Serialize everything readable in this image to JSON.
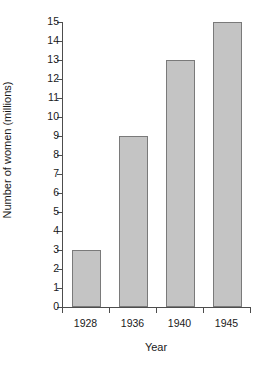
{
  "chart_data": {
    "type": "bar",
    "title": "",
    "subtitle": "",
    "categories": [
      "1928",
      "1936",
      "1940",
      "1945"
    ],
    "values": [
      3,
      9,
      13,
      15
    ],
    "series": [
      {
        "name": "Number of women (millions)",
        "values": [
          3,
          9,
          13,
          15
        ]
      }
    ],
    "xlabel": "Year",
    "ylabel": "Number of women (millions)",
    "ylim": [
      0,
      15
    ],
    "yticks": [
      0,
      1,
      2,
      3,
      4,
      5,
      6,
      7,
      8,
      9,
      10,
      11,
      12,
      13,
      14,
      15
    ],
    "ytick_labels": [
      "0",
      "1",
      "2",
      "3",
      "4",
      "5",
      "6",
      "7",
      "8",
      "9",
      "10",
      "11",
      "12",
      "13",
      "14",
      "15"
    ],
    "xtick_labels": [
      "1928",
      "1936",
      "1940",
      "1945"
    ],
    "grid": false,
    "legend": false,
    "legend_position": "none",
    "bar_color": "#c4c4c4",
    "bar_edge_color": "#7a7a7a",
    "axis_color": "#4d4d4d",
    "text_color": "#1a1a1a",
    "background_color": "#ffffff",
    "annotations": []
  }
}
